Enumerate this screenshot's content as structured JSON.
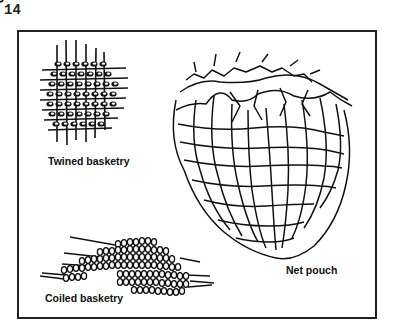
{
  "page": {
    "number": "14"
  },
  "figure": {
    "panels": [
      {
        "id": "twined",
        "caption": "Twined basketry"
      },
      {
        "id": "net",
        "caption": "Net pouch"
      },
      {
        "id": "coiled",
        "caption": "Coiled basketry"
      }
    ]
  }
}
